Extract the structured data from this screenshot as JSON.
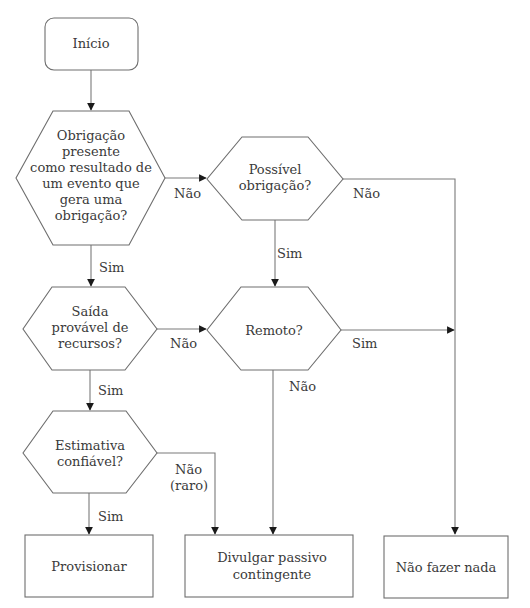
{
  "diagram": {
    "type": "flowchart",
    "colors": {
      "background": "#ffffff",
      "stroke": "#6e6e6e",
      "text": "#3a3a3a",
      "arrowhead": "#1a1a1a"
    },
    "nodes": {
      "start": {
        "shape": "rounded-rectangle",
        "lines": [
          "Início"
        ]
      },
      "q_obligation": {
        "shape": "hexagon",
        "lines": [
          "Obrigação",
          "presente",
          "como resultado de",
          "um evento que",
          "gera uma",
          "obrigação?"
        ]
      },
      "q_possible": {
        "shape": "hexagon",
        "lines": [
          "Possível",
          "obrigação?"
        ]
      },
      "q_outflow": {
        "shape": "hexagon",
        "lines": [
          "Saída",
          "provável de",
          "recursos?"
        ]
      },
      "q_remote": {
        "shape": "hexagon",
        "lines": [
          "Remoto?"
        ]
      },
      "q_estimate": {
        "shape": "hexagon",
        "lines": [
          "Estimativa",
          "confiável?"
        ]
      },
      "out_provision": {
        "shape": "rectangle",
        "lines": [
          "Provisionar"
        ]
      },
      "out_disclose": {
        "shape": "rectangle",
        "lines": [
          "Divulgar passivo",
          "contingente"
        ]
      },
      "out_nothing": {
        "shape": "rectangle",
        "lines": [
          "Não fazer nada"
        ]
      }
    },
    "edges": [
      {
        "from": "start",
        "to": "q_obligation",
        "label": ""
      },
      {
        "from": "q_obligation",
        "to": "q_possible",
        "label": "Não"
      },
      {
        "from": "q_obligation",
        "to": "q_outflow",
        "label": "Sim"
      },
      {
        "from": "q_possible",
        "to": "out_nothing",
        "label": "Não"
      },
      {
        "from": "q_possible",
        "to": "q_remote",
        "label": "Sim"
      },
      {
        "from": "q_outflow",
        "to": "q_remote",
        "label": "Não"
      },
      {
        "from": "q_outflow",
        "to": "q_estimate",
        "label": "Sim"
      },
      {
        "from": "q_remote",
        "to": "out_nothing",
        "label": "Sim"
      },
      {
        "from": "q_remote",
        "to": "out_disclose",
        "label": "Não"
      },
      {
        "from": "q_estimate",
        "to": "out_provision",
        "label": "Sim"
      },
      {
        "from": "q_estimate",
        "to": "out_disclose",
        "label_lines": [
          "Não",
          "(raro)"
        ]
      }
    ]
  }
}
